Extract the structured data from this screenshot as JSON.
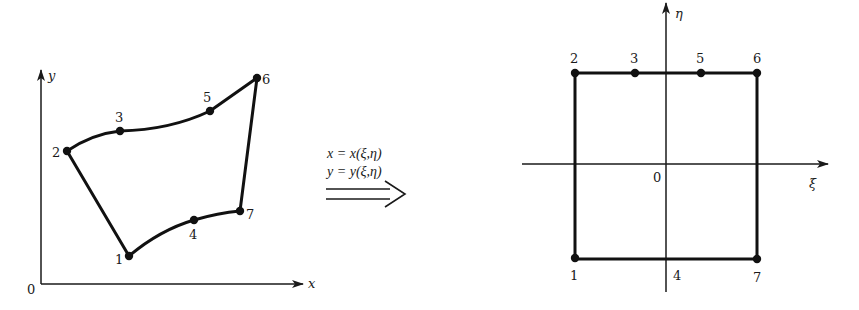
{
  "figure": {
    "physical_domain": {
      "axes": {
        "x_label": "x",
        "y_label": "y",
        "origin_label": "0"
      },
      "nodes": [
        {
          "id": "1",
          "x": 129,
          "y": 256
        },
        {
          "id": "2",
          "x": 67,
          "y": 151
        },
        {
          "id": "3",
          "x": 120,
          "y": 131
        },
        {
          "id": "4",
          "x": 194,
          "y": 220
        },
        {
          "id": "5",
          "x": 210,
          "y": 111
        },
        {
          "id": "6",
          "x": 257,
          "y": 78
        },
        {
          "id": "7",
          "x": 240,
          "y": 211
        }
      ]
    },
    "mapping": {
      "line1": "x = x(ξ,η)",
      "line2": "y = y(ξ,η)",
      "arrow": "double-line-arrow"
    },
    "natural_domain": {
      "axes": {
        "xi_label": "ξ",
        "eta_label": "η",
        "origin_label": "0"
      },
      "nodes": [
        {
          "id": "1",
          "x": 575,
          "y": 258,
          "dot": true
        },
        {
          "id": "2",
          "x": 575,
          "y": 73,
          "dot": true
        },
        {
          "id": "3",
          "x": 635,
          "y": 73,
          "dot": true
        },
        {
          "id": "4",
          "x": 666,
          "y": 258,
          "dot": false
        },
        {
          "id": "5",
          "x": 701,
          "y": 73,
          "dot": true
        },
        {
          "id": "6",
          "x": 757,
          "y": 73,
          "dot": true
        },
        {
          "id": "7",
          "x": 757,
          "y": 259,
          "dot": true
        }
      ]
    }
  }
}
